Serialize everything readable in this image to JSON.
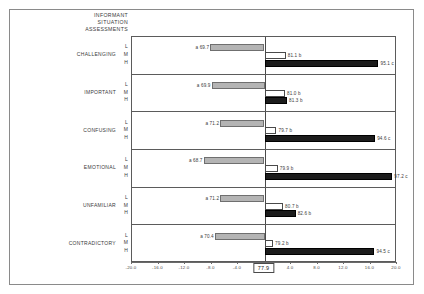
{
  "chart_data": {
    "type": "bar",
    "title": "INFORMANT SITUATION ASSESSMENTS",
    "title_lines": [
      "INFORMANT",
      "SITUATION",
      "ASSESSMENTS"
    ],
    "orientation": "horizontal",
    "style": "deviation-from-grand-mean",
    "center_value": 77.9,
    "center_label": "77.9",
    "xlabel": "",
    "ylabel": "",
    "xlim": [
      -20.0,
      20.0
    ],
    "xticks": [
      -20.0,
      -16.0,
      -12.0,
      -8.0,
      -4.0,
      0.0,
      4.0,
      8.0,
      12.0,
      16.0,
      20.0
    ],
    "xtick_labels": [
      "-20.0",
      "-16.0",
      "-12.0",
      "-8.0",
      "-4.0",
      "0.0",
      "4.0",
      "8.0",
      "12.0",
      "16.0",
      "20.0"
    ],
    "grid": false,
    "legend": "none",
    "level_keys": [
      "L",
      "M",
      "H"
    ],
    "series": [
      {
        "name": "L",
        "fill": "#b4b4b4",
        "style": "light-gray"
      },
      {
        "name": "M",
        "fill": "#ffffff",
        "style": "white-outline"
      },
      {
        "name": "H",
        "fill": "#1c1c1c",
        "style": "black"
      }
    ],
    "categories": [
      "CHALLENGING",
      "IMPORTANT",
      "CONFUSING",
      "EMOTIONAL",
      "UNFAMILIAR",
      "CONTRADICTORY"
    ],
    "groups": [
      {
        "category": "CHALLENGING",
        "bars": [
          {
            "level": "L",
            "value": 69.7,
            "deviation": -8.2,
            "label": "a 69.7",
            "sig": "a"
          },
          {
            "level": "M",
            "value": 81.1,
            "deviation": 3.2,
            "label": "81.1 b",
            "sig": "b"
          },
          {
            "level": "H",
            "value": 95.1,
            "deviation": 17.2,
            "label": "95.1 c",
            "sig": "c"
          }
        ]
      },
      {
        "category": "IMPORTANT",
        "bars": [
          {
            "level": "L",
            "value": 69.9,
            "deviation": -8.0,
            "label": "a 69.9",
            "sig": "a"
          },
          {
            "level": "M",
            "value": 81.0,
            "deviation": 3.1,
            "label": "81.0 b",
            "sig": "b"
          },
          {
            "level": "H",
            "value": 81.3,
            "deviation": 3.4,
            "label": "81.3 b",
            "sig": "b"
          }
        ]
      },
      {
        "category": "CONFUSING",
        "bars": [
          {
            "level": "L",
            "value": 71.2,
            "deviation": -6.7,
            "label": "a 71.2",
            "sig": "a"
          },
          {
            "level": "M",
            "value": 79.7,
            "deviation": 1.8,
            "label": "79.7 b",
            "sig": "b"
          },
          {
            "level": "H",
            "value": 94.6,
            "deviation": 16.7,
            "label": "94.6 c",
            "sig": "c"
          }
        ]
      },
      {
        "category": "EMOTIONAL",
        "bars": [
          {
            "level": "L",
            "value": 68.7,
            "deviation": -9.2,
            "label": "a 68.7",
            "sig": "a"
          },
          {
            "level": "M",
            "value": 79.9,
            "deviation": 2.0,
            "label": "79.9 b",
            "sig": "b"
          },
          {
            "level": "H",
            "value": 97.2,
            "deviation": 19.3,
            "label": "97.2 c",
            "sig": "c"
          }
        ]
      },
      {
        "category": "UNFAMILIAR",
        "bars": [
          {
            "level": "L",
            "value": 71.2,
            "deviation": -6.7,
            "label": "a 71.2",
            "sig": "a"
          },
          {
            "level": "M",
            "value": 80.7,
            "deviation": 2.8,
            "label": "80.7 b",
            "sig": "b"
          },
          {
            "level": "H",
            "value": 82.6,
            "deviation": 4.7,
            "label": "82.6 b",
            "sig": "b"
          }
        ]
      },
      {
        "category": "CONTRADICTORY",
        "bars": [
          {
            "level": "L",
            "value": 70.4,
            "deviation": -7.5,
            "label": "a 70.4",
            "sig": "a"
          },
          {
            "level": "M",
            "value": 79.2,
            "deviation": 1.3,
            "label": "79.2 b",
            "sig": "b"
          },
          {
            "level": "H",
            "value": 94.5,
            "deviation": 16.6,
            "label": "94.5 c",
            "sig": "c"
          }
        ]
      }
    ]
  }
}
